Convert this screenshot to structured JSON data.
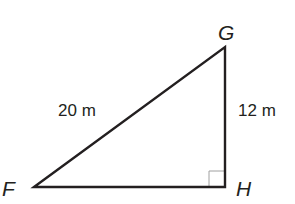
{
  "diagram": {
    "type": "right-triangle",
    "vertices": [
      {
        "name": "F",
        "x": 34,
        "y": 187
      },
      {
        "name": "G",
        "x": 225,
        "y": 47
      },
      {
        "name": "H",
        "x": 225,
        "y": 187
      }
    ],
    "labels": {
      "vertex_f": "F",
      "vertex_g": "G",
      "vertex_h": "H",
      "side_fg": "20 m",
      "side_gh": "12 m"
    },
    "sides": [
      {
        "from": "F",
        "to": "G",
        "length": "20 m",
        "role": "hypotenuse"
      },
      {
        "from": "G",
        "to": "H",
        "length": "12 m",
        "role": "leg"
      },
      {
        "from": "F",
        "to": "H",
        "length": "",
        "role": "leg"
      }
    ],
    "right_angle_at": "H",
    "colors": {
      "stroke": "#231f20",
      "right_angle_marker": "#9a9a9a",
      "background": "#ffffff"
    }
  }
}
